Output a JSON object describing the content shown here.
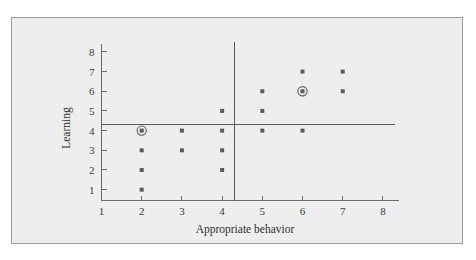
{
  "figure": {
    "panel_bg": "#eeeeee",
    "panel_border": "#9b9b9b",
    "ink": "#5b5b5b",
    "page_bg": "#ffffff"
  },
  "chart_data": {
    "type": "scatter",
    "title": "",
    "subtitle": "",
    "xlabel": "Appropriate behavior",
    "ylabel": "Learning",
    "xlim": [
      1,
      8.4
    ],
    "ylim": [
      0.45,
      8.4
    ],
    "x_ticks": [
      1,
      2,
      3,
      4,
      5,
      6,
      7,
      8
    ],
    "x_tick_labels": [
      "1",
      "2",
      "3",
      "4",
      "5",
      "6",
      "7",
      "8"
    ],
    "y_ticks": [
      1,
      2,
      3,
      4,
      5,
      6,
      7,
      8
    ],
    "y_tick_labels": [
      "1",
      "2",
      "3",
      "4",
      "5",
      "6",
      "7",
      "8"
    ],
    "grid": false,
    "legend": null,
    "marker": "filled-square-dot",
    "points": [
      {
        "x": 2,
        "y": 4,
        "highlighted": true
      },
      {
        "x": 2,
        "y": 3,
        "highlighted": false
      },
      {
        "x": 2,
        "y": 2,
        "highlighted": false
      },
      {
        "x": 2,
        "y": 1,
        "highlighted": false
      },
      {
        "x": 3,
        "y": 4,
        "highlighted": false
      },
      {
        "x": 3,
        "y": 3,
        "highlighted": false
      },
      {
        "x": 4,
        "y": 5,
        "highlighted": false
      },
      {
        "x": 4,
        "y": 4,
        "highlighted": false
      },
      {
        "x": 4,
        "y": 3,
        "highlighted": false
      },
      {
        "x": 4,
        "y": 2,
        "highlighted": false
      },
      {
        "x": 5,
        "y": 6,
        "highlighted": false
      },
      {
        "x": 5,
        "y": 5,
        "highlighted": false
      },
      {
        "x": 5,
        "y": 4,
        "highlighted": false
      },
      {
        "x": 6,
        "y": 7,
        "highlighted": false
      },
      {
        "x": 6,
        "y": 6,
        "highlighted": true
      },
      {
        "x": 6,
        "y": 4,
        "highlighted": false
      },
      {
        "x": 7,
        "y": 7,
        "highlighted": false
      },
      {
        "x": 7,
        "y": 6,
        "highlighted": false
      }
    ],
    "reference_lines": [
      {
        "orientation": "vertical",
        "value": 4.3,
        "label": ""
      },
      {
        "orientation": "horizontal",
        "value": 4.3,
        "label": ""
      }
    ],
    "annotations": []
  }
}
